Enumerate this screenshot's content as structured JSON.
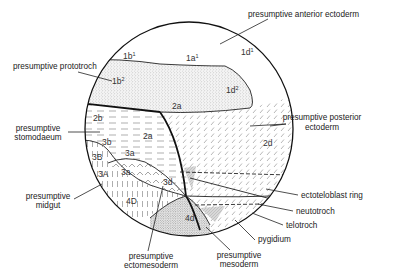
{
  "diagram": {
    "labels": {
      "anterior_ectoderm": "presumptive anterior ectoderm",
      "prototroch": "presumptive prototroch",
      "posterior_ectoderm_line1": "presumptive posterior",
      "posterior_ectoderm_line2": "ectoderm",
      "stomodaeum_line1": "presumptive",
      "stomodaeum_line2": "stomodaeum",
      "midgut_line1": "presumptive",
      "midgut_line2": "midgut",
      "ectoteloblast_ring": "ectoteloblast ring",
      "neutotroch": "neutotroch",
      "telotroch": "telotroch",
      "pygidium": "pygidium",
      "mesoderm_line1": "presumptive",
      "mesoderm_line2": "mesoderm",
      "ectomesoderm_line1": "presumptive",
      "ectomesoderm_line2": "ectomesoderm"
    },
    "cells": {
      "c1b1": {
        "base": "1b",
        "sup": "1"
      },
      "c1a1": {
        "base": "1a",
        "sup": "1"
      },
      "c1d1": {
        "base": "1d",
        "sup": "1"
      },
      "c1b2": {
        "base": "1b",
        "sup": "2"
      },
      "c1d2": {
        "base": "1d",
        "sup": "2"
      },
      "c2a_top": "2a",
      "c2b": "2b",
      "c2a_mid": "2a",
      "c2d": "2d",
      "c3b": "3b",
      "c3B": "3B",
      "c3a_upper": "3a",
      "c3a_lower": "3a",
      "c3A": "3A",
      "c3d": "3d",
      "c4D": "4D",
      "c4d": "4d"
    }
  }
}
